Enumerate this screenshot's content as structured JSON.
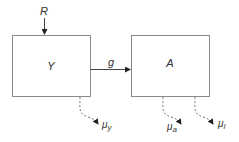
{
  "diagram": {
    "nodes": [
      {
        "id": "Y",
        "label": "Y"
      },
      {
        "id": "A",
        "label": "A"
      }
    ],
    "input": {
      "label": "R",
      "target": "Y"
    },
    "edges": [
      {
        "from": "Y",
        "to": "A",
        "label": "g"
      }
    ],
    "outflows": [
      {
        "from": "Y",
        "label": "μ",
        "subscript": "y"
      },
      {
        "from": "A",
        "label": "μ",
        "subscript": "a"
      },
      {
        "from": "A",
        "label": "μ",
        "subscript": "l"
      }
    ]
  },
  "colors": {
    "box_stroke": "#8a8a8a",
    "arrow": "#444444",
    "dashed": "#7a7a7a",
    "text": "#333333"
  }
}
